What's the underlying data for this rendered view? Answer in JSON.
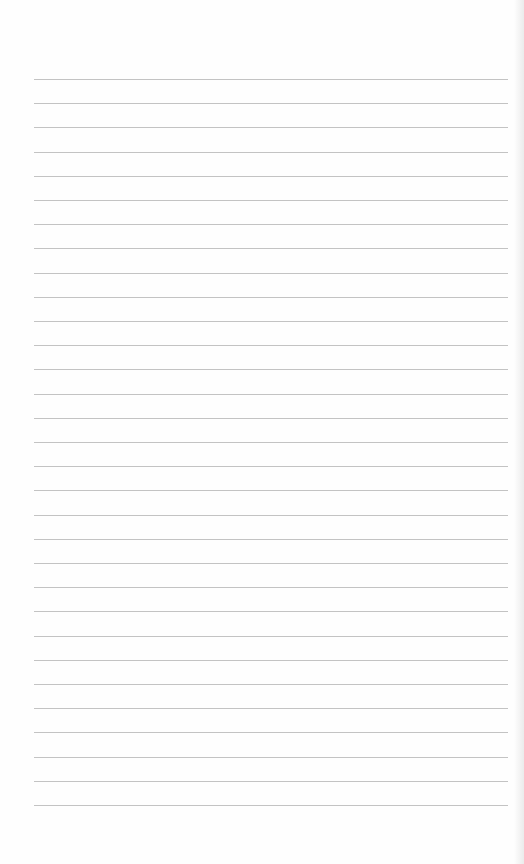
{
  "paper": {
    "kind": "ruled-notebook-page",
    "line_count": 31,
    "first_line_y": 79,
    "line_spacing": 24.2,
    "line_left": 34,
    "line_right": 508,
    "colors": {
      "background": "#fefefe",
      "rule": "#b9b9b9"
    }
  }
}
